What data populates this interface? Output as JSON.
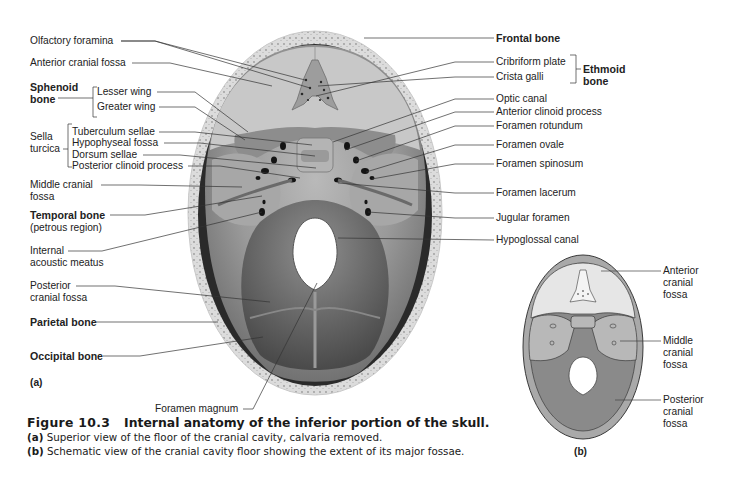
{
  "figure": {
    "number": "Figure 10.3",
    "title": "Internal anatomy of the inferior portion of the skull.",
    "captions": [
      {
        "tag": "(a)",
        "text": "Superior view of the floor of the cranial cavity, calvaria removed."
      },
      {
        "tag": "(b)",
        "text": "Schematic view of the cranial cavity floor showing the extent of its major fossae."
      }
    ]
  },
  "panel_a": {
    "tag": "(a)",
    "left_labels": [
      {
        "id": "olfactory-foramina",
        "text": "Olfactory foramina",
        "bold": false
      },
      {
        "id": "anterior-cranial-fossa",
        "text": "Anterior cranial fossa",
        "bold": false
      },
      {
        "id": "sphenoid-bone",
        "text": "Sphenoid bone",
        "line1": "Sphenoid",
        "line2": "bone",
        "bold": true
      },
      {
        "id": "lesser-wing",
        "text": "Lesser wing",
        "bold": false
      },
      {
        "id": "greater-wing",
        "text": "Greater wing",
        "bold": false
      },
      {
        "id": "sella-turcica",
        "text": "Sella turcica",
        "line1": "Sella",
        "line2": "turcica",
        "bold": false
      },
      {
        "id": "tuberculum-sellae",
        "text": "Tuberculum sellae",
        "bold": false
      },
      {
        "id": "hypophyseal-fossa",
        "text": "Hypophyseal fossa",
        "bold": false
      },
      {
        "id": "dorsum-sellae",
        "text": "Dorsum sellae",
        "bold": false
      },
      {
        "id": "posterior-clinoid-process",
        "text": "Posterior clinoid process",
        "bold": false
      },
      {
        "id": "middle-cranial-fossa",
        "text": "Middle cranial fossa",
        "line1": "Middle cranial",
        "line2": "fossa",
        "bold": false
      },
      {
        "id": "temporal-bone",
        "text": "Temporal bone",
        "sub": "(petrous region)",
        "bold": true
      },
      {
        "id": "internal-acoustic-meatus",
        "text": "Internal acoustic meatus",
        "line1": "Internal",
        "line2": "acoustic meatus",
        "bold": false
      },
      {
        "id": "posterior-cranial-fossa",
        "text": "Posterior cranial fossa",
        "line1": "Posterior",
        "line2": "cranial fossa",
        "bold": false
      },
      {
        "id": "parietal-bone",
        "text": "Parietal bone",
        "bold": true
      },
      {
        "id": "occipital-bone",
        "text": "Occipital bone",
        "bold": true
      },
      {
        "id": "foramen-magnum",
        "text": "Foramen magnum",
        "bold": false
      }
    ],
    "right_labels": [
      {
        "id": "frontal-bone",
        "text": "Frontal bone",
        "bold": true
      },
      {
        "id": "cribriform-plate",
        "text": "Cribriform plate",
        "bold": false
      },
      {
        "id": "crista-galli",
        "text": "Crista galli",
        "bold": false
      },
      {
        "id": "ethmoid-bone",
        "text": "Ethmoid bone",
        "line1": "Ethmoid",
        "line2": "bone",
        "bold": true
      },
      {
        "id": "optic-canal",
        "text": "Optic canal",
        "bold": false
      },
      {
        "id": "anterior-clinoid-process",
        "text": "Anterior clinoid process",
        "bold": false
      },
      {
        "id": "foramen-rotundum",
        "text": "Foramen rotundum",
        "bold": false
      },
      {
        "id": "foramen-ovale",
        "text": "Foramen ovale",
        "bold": false
      },
      {
        "id": "foramen-spinosum",
        "text": "Foramen spinosum",
        "bold": false
      },
      {
        "id": "foramen-lacerum",
        "text": "Foramen lacerum",
        "bold": false
      },
      {
        "id": "jugular-foramen",
        "text": "Jugular foramen",
        "bold": false
      },
      {
        "id": "hypoglossal-canal",
        "text": "Hypoglossal canal",
        "bold": false
      }
    ]
  },
  "panel_b": {
    "tag": "(b)",
    "labels": [
      {
        "id": "b-anterior-cranial-fossa",
        "line1": "Anterior",
        "line2": "cranial",
        "line3": "fossa"
      },
      {
        "id": "b-middle-cranial-fossa",
        "line1": "Middle",
        "line2": "cranial",
        "line3": "fossa"
      },
      {
        "id": "b-posterior-cranial-fossa",
        "line1": "Posterior",
        "line2": "cranial",
        "line3": "fossa"
      }
    ],
    "colors": {
      "anterior": "#e6e6e6",
      "middle": "#b8b8b8",
      "posterior": "#8a8a8a",
      "rim": "#a9a9a9"
    }
  }
}
